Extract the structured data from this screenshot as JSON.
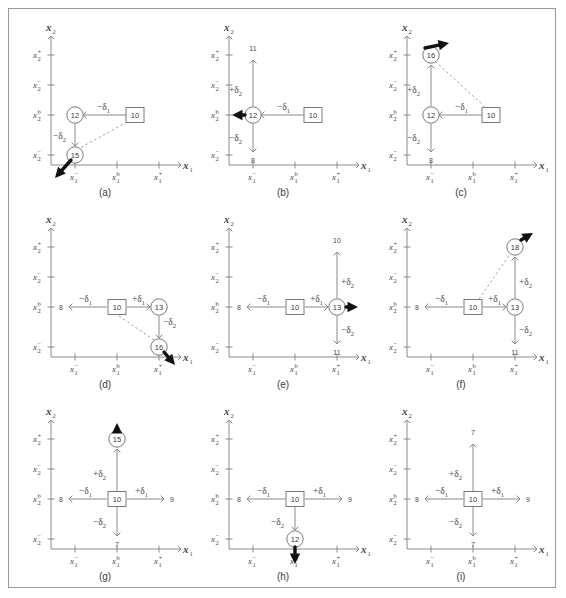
{
  "figure": {
    "axis_labels": {
      "x": "x",
      "x_sub": "1",
      "y": "x",
      "y_sub": "2"
    },
    "x_ticks": [
      {
        "base": "x",
        "sub": "1",
        "sup": "−"
      },
      {
        "base": "x",
        "sub": "1",
        "sup": "b"
      },
      {
        "base": "x",
        "sub": "1",
        "sup": "+"
      }
    ],
    "y_ticks": [
      {
        "base": "x",
        "sub": "2",
        "sup": "+"
      },
      {
        "base": "x",
        "sub": "2",
        "sup": "−"
      },
      {
        "base": "x",
        "sub": "2",
        "sup": "b"
      },
      {
        "base": "x",
        "sub": "2",
        "sup": "−"
      }
    ],
    "deltas": {
      "minus_d1": "−δ",
      "plus_d1": "+δ",
      "minus_d2": "−δ",
      "plus_d2": "+δ",
      "sub1": "1",
      "sub2": "2"
    },
    "colors": {
      "axis": "#8a8a8a",
      "edge": "#8a8a8a",
      "dashed": "#9a9a9a",
      "node_stroke": "#7a7a7a",
      "arrow": "#111111",
      "frame": "#9a9a9a",
      "background": "#ffffff"
    }
  },
  "panels": [
    {
      "id": "a",
      "caption": "(a)",
      "nodes": [
        {
          "name": "root-square",
          "shape": "square",
          "value": "10"
        },
        {
          "name": "child-circle-left",
          "shape": "circle",
          "value": "12"
        },
        {
          "name": "leaf-circle-bottom",
          "shape": "circle",
          "value": "15"
        }
      ],
      "edge_labels": [
        "−δ₁",
        "−δ₂"
      ],
      "end_values": [],
      "bold_arrow": "down-left"
    },
    {
      "id": "b",
      "caption": "(b)",
      "nodes": [
        {
          "name": "root-square",
          "shape": "square",
          "value": "10"
        },
        {
          "name": "center-circle",
          "shape": "circle",
          "value": "12"
        }
      ],
      "edge_labels": [
        "−δ₁",
        "+δ₂",
        "−δ₂"
      ],
      "end_values": [
        "11",
        "8"
      ],
      "bold_arrow": "left"
    },
    {
      "id": "c",
      "caption": "(c)",
      "nodes": [
        {
          "name": "root-square",
          "shape": "square",
          "value": "10"
        },
        {
          "name": "center-circle",
          "shape": "circle",
          "value": "12"
        },
        {
          "name": "leaf-circle-top",
          "shape": "circle",
          "value": "16"
        }
      ],
      "edge_labels": [
        "−δ₁",
        "+δ₂",
        "−δ₂"
      ],
      "end_values": [
        "8"
      ],
      "bold_arrow": "up-left"
    },
    {
      "id": "d",
      "caption": "(d)",
      "nodes": [
        {
          "name": "root-square",
          "shape": "square",
          "value": "10"
        },
        {
          "name": "center-circle",
          "shape": "circle",
          "value": "13"
        },
        {
          "name": "leaf-circle-bottom",
          "shape": "circle",
          "value": "16"
        }
      ],
      "edge_labels": [
        "−δ₁",
        "+δ₁",
        "−δ₂"
      ],
      "end_values": [
        "8"
      ],
      "bold_arrow": "down-right"
    },
    {
      "id": "e",
      "caption": "(e)",
      "nodes": [
        {
          "name": "root-square",
          "shape": "square",
          "value": "10"
        },
        {
          "name": "center-circle",
          "shape": "circle",
          "value": "13"
        }
      ],
      "edge_labels": [
        "−δ₁",
        "+δ₁",
        "+δ₂",
        "−δ₂"
      ],
      "end_values": [
        "8",
        "10",
        "11"
      ],
      "bold_arrow": "right"
    },
    {
      "id": "f",
      "caption": "(f)",
      "nodes": [
        {
          "name": "root-square",
          "shape": "square",
          "value": "10"
        },
        {
          "name": "center-circle",
          "shape": "circle",
          "value": "13"
        },
        {
          "name": "leaf-circle-top",
          "shape": "circle",
          "value": "18"
        }
      ],
      "edge_labels": [
        "−δ₁",
        "+δ₁",
        "+δ₂",
        "−δ₂"
      ],
      "end_values": [
        "8",
        "11"
      ],
      "bold_arrow": "up-right"
    },
    {
      "id": "g",
      "caption": "(g)",
      "nodes": [
        {
          "name": "root-square",
          "shape": "square",
          "value": "10"
        },
        {
          "name": "leaf-circle-top",
          "shape": "circle",
          "value": "15"
        }
      ],
      "edge_labels": [
        "−δ₁",
        "+δ₁",
        "+δ₂",
        "−δ₂"
      ],
      "end_values": [
        "8",
        "9",
        "7"
      ],
      "bold_arrow": "up"
    },
    {
      "id": "h",
      "caption": "(h)",
      "nodes": [
        {
          "name": "root-square",
          "shape": "square",
          "value": "10"
        },
        {
          "name": "leaf-circle-bottom",
          "shape": "circle",
          "value": "12"
        }
      ],
      "edge_labels": [
        "−δ₁",
        "+δ₁",
        "−δ₂"
      ],
      "end_values": [
        "8",
        "9"
      ],
      "bold_arrow": "down"
    },
    {
      "id": "i",
      "caption": "(i)",
      "nodes": [
        {
          "name": "root-square",
          "shape": "square",
          "value": "10"
        }
      ],
      "edge_labels": [
        "−δ₁",
        "+δ₁",
        "+δ₂",
        "−δ₂"
      ],
      "end_values": [
        "8",
        "9",
        "7",
        "7"
      ],
      "bold_arrow": "none"
    }
  ]
}
